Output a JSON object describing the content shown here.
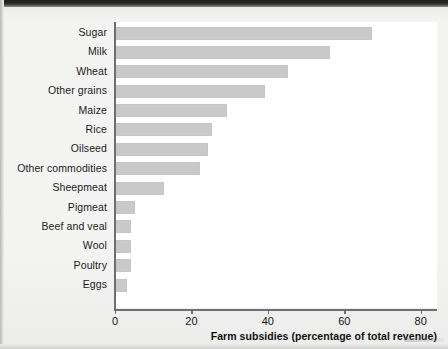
{
  "chart_data": {
    "type": "bar",
    "orientation": "horizontal",
    "title": "",
    "xlabel": "Farm subsidies (percentage of total revenue)",
    "ylabel": "",
    "xlim": [
      0,
      84
    ],
    "xticks": [
      0,
      20,
      40,
      60,
      80
    ],
    "xtick_labels": [
      "0",
      "20",
      "40",
      "60",
      "80"
    ],
    "grid": false,
    "legend": "none",
    "bar_color": "#c9c9c9",
    "axis_color": "#6f6f6f",
    "plot_background": "#ffffff",
    "page_background": "#f3f3f1",
    "categories": [
      "Sugar",
      "Milk",
      "Wheat",
      "Other grains",
      "Maize",
      "Rice",
      "Oilseed",
      "Other commodities",
      "Sheepmeat",
      "Pigmeat",
      "Beef and veal",
      "Wool",
      "Poultry",
      "Eggs"
    ],
    "values": [
      67,
      56,
      45,
      39,
      29,
      25,
      24,
      22,
      12.5,
      5,
      4,
      4,
      4,
      3
    ],
    "series": [
      {
        "name": "Farm subsidies",
        "values": [
          67,
          56,
          45,
          39,
          29,
          25,
          24,
          22,
          12.5,
          5,
          4,
          4,
          4,
          3
        ]
      }
    ]
  }
}
